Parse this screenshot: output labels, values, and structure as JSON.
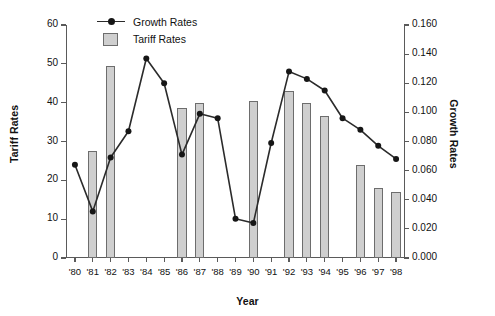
{
  "chart_data": {
    "type": "bar",
    "title": "",
    "xlabel": "Year",
    "ylabel": "Tariff Rates",
    "y2label": "Growth Rates",
    "grid": false,
    "legend_position": "top-left",
    "categories": [
      "'80",
      "'81",
      "'82",
      "'83",
      "'84",
      "'85",
      "'86",
      "'87",
      "'88",
      "'89",
      "'90",
      "'91",
      "'92",
      "'93",
      "'94",
      "'95",
      "'96",
      "'97",
      "'98"
    ],
    "ylim": [
      0,
      60
    ],
    "yticks": [
      "0",
      "10",
      "20",
      "30",
      "40",
      "50",
      "60"
    ],
    "y2lim": [
      0,
      0.16
    ],
    "y2ticks": [
      "0.000",
      "0.020",
      "0.040",
      "0.060",
      "0.080",
      "0.100",
      "0.120",
      "0.140",
      "0.160"
    ],
    "series": [
      {
        "name": "Tariff Rates",
        "kind": "bar",
        "axis": "left",
        "color": "#cfcfcf",
        "edge_color": "#6d6d6d",
        "values": [
          null,
          27.5,
          49.5,
          null,
          null,
          null,
          38.5,
          40.0,
          null,
          null,
          40.5,
          null,
          43.0,
          40.0,
          36.5,
          null,
          24.0,
          18.0,
          17.0
        ]
      },
      {
        "name": "Growth Rates",
        "kind": "line",
        "axis": "right",
        "color": "#2b2b2b",
        "marker": "circle",
        "values": [
          0.064,
          0.032,
          0.069,
          0.087,
          0.137,
          0.12,
          0.071,
          0.099,
          0.096,
          0.027,
          0.024,
          0.079,
          0.128,
          0.123,
          0.115,
          0.096,
          0.088,
          0.077,
          0.068
        ]
      }
    ]
  },
  "legend": {
    "items": [
      {
        "label": "Growth Rates",
        "key": "line-marker-key"
      },
      {
        "label": "Tariff Rates",
        "key": "gray-swatch-key"
      }
    ]
  },
  "axes": {
    "left_title": "Tariff Rates",
    "right_title": "Growth Rates",
    "x_title": "Year"
  }
}
